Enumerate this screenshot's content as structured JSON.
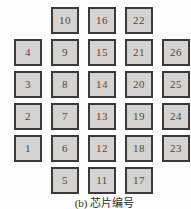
{
  "figure": {
    "caption": "(b) 芯片编号"
  },
  "grid": {
    "rows": 6,
    "cols": 5,
    "cells": [
      [
        null,
        10,
        16,
        22,
        null
      ],
      [
        4,
        9,
        15,
        21,
        26
      ],
      [
        3,
        8,
        14,
        20,
        25
      ],
      [
        2,
        7,
        13,
        19,
        24
      ],
      [
        1,
        6,
        12,
        18,
        23
      ],
      [
        null,
        5,
        11,
        17,
        null
      ]
    ]
  },
  "colors": {
    "background": "#fdfdfc",
    "chip_fill": "#d4d3cf",
    "chip_border": "#3c3b39",
    "chip_text": "#4a4a48",
    "caption_text": "#2f2e2c"
  }
}
